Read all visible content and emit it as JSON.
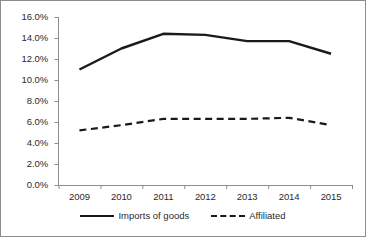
{
  "chart_data": {
    "type": "line",
    "title": "",
    "subtitle": "",
    "xlabel": "",
    "ylabel": "",
    "categories": [
      "2009",
      "2010",
      "2011",
      "2012",
      "2013",
      "2014",
      "2015"
    ],
    "x": [
      2009,
      2010,
      2011,
      2012,
      2013,
      2014,
      2015
    ],
    "series": [
      {
        "name": "Imports of goods",
        "style": "solid",
        "color": "#1a1a1a",
        "values": [
          11.0,
          13.0,
          14.4,
          14.3,
          13.7,
          13.7,
          12.5
        ]
      },
      {
        "name": "Affiliated",
        "style": "dashed",
        "color": "#1a1a1a",
        "values": [
          5.2,
          5.7,
          6.3,
          6.3,
          6.3,
          6.4,
          5.7
        ]
      }
    ],
    "ylim": [
      0.0,
      16.0
    ],
    "yticks": [
      0.0,
      2.0,
      4.0,
      6.0,
      8.0,
      10.0,
      12.0,
      14.0,
      16.0
    ],
    "ytick_labels": [
      "0.0%",
      "2.0%",
      "4.0%",
      "6.0%",
      "8.0%",
      "10.0%",
      "12.0%",
      "14.0%",
      "16.0%"
    ],
    "value_suffix": "%",
    "grid": false,
    "legend_position": "bottom",
    "legend_entries": [
      "Imports of goods",
      "Affiliated"
    ],
    "axis_color": "#8c8c8c",
    "text_color": "#2b2b2b"
  }
}
